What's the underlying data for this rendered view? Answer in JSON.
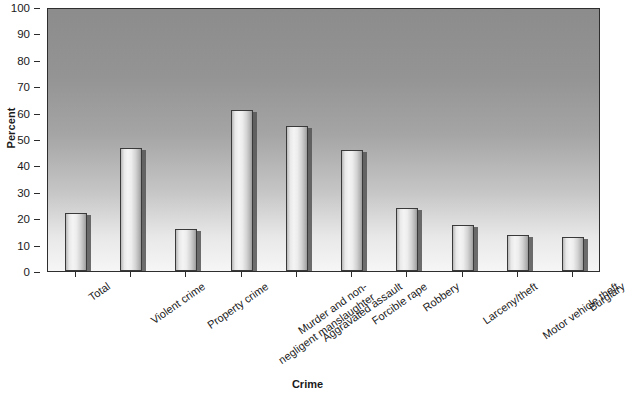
{
  "chart_data": {
    "type": "bar",
    "title": "",
    "xlabel": "Crime",
    "ylabel": "Percent",
    "ylim": [
      0,
      100
    ],
    "ytick_values": [
      0,
      10,
      20,
      30,
      40,
      50,
      60,
      70,
      80,
      90,
      100
    ],
    "ytick_labels": [
      "0",
      "10",
      "20",
      "30",
      "40",
      "50",
      "60",
      "70",
      "80",
      "90",
      "100"
    ],
    "grid": false,
    "legend": null,
    "categories": [
      "Total",
      "Violent crime",
      "Property crime",
      "Murder and non-negligent manslaughter",
      "Aggravated assault",
      "Forcible rape",
      "Robbery",
      "Larceny/theft",
      "Motor vehicle theft",
      "Burglary"
    ],
    "category_lines": [
      [
        "Total"
      ],
      [
        "Violent crime"
      ],
      [
        "Property crime"
      ],
      [
        "Murder and non-",
        "negligent manslaughter"
      ],
      [
        "Aggravated assault"
      ],
      [
        "Forcible rape"
      ],
      [
        "Robbery"
      ],
      [
        "Larceny/theft"
      ],
      [
        "Motor vehicle theft"
      ],
      [
        "Burglary"
      ]
    ],
    "values": [
      22,
      46.5,
      16,
      61,
      55,
      46,
      24,
      17.5,
      13.5,
      13
    ],
    "bar_face_color": "#eeeeee",
    "bar_edge_color": "#3a3a3a",
    "plot_bg_top_color": "#8c8c8c",
    "plot_bg_bottom_color": "#f6f6f6",
    "axis_color": "#2e2e2e"
  }
}
